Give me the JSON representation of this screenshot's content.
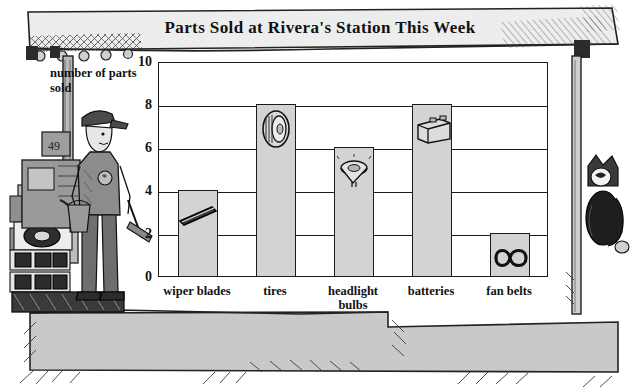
{
  "title": "Parts Sold at Rivera's Station This Week",
  "axis_label": "number of parts sold",
  "colors": {
    "bar_fill": "#d3d3d3",
    "outline": "#1a1a1a",
    "plot_background": "#ffffff",
    "ground": "#c9c9c9",
    "banner": "#ededed",
    "figure_dark": "#2b2b2b"
  },
  "scene": {
    "attendant": "gas-station-attendant",
    "gas_pump": "gas-pump",
    "awning": "station-awning-with-lights",
    "cat": "hanging-cat-figure",
    "stacked_parts": "stacked-tires-and-batteries",
    "ground": "pavement"
  },
  "chart_data": {
    "type": "bar",
    "title": "Parts Sold at Rivera's Station This Week",
    "xlabel": "",
    "ylabel": "number of parts sold",
    "categories": [
      "wiper blades",
      "tires",
      "headlight bulbs",
      "batteries",
      "fan belts"
    ],
    "values": [
      4,
      8,
      6,
      8,
      2
    ],
    "icons": [
      "wiper-blade-icon",
      "tire-icon",
      "headlight-bulb-icon",
      "battery-icon",
      "fan-belt-icon"
    ],
    "ylim": [
      0,
      10
    ],
    "yticks": [
      0,
      2,
      4,
      6,
      8,
      10
    ],
    "grid": true,
    "legend": "none"
  }
}
